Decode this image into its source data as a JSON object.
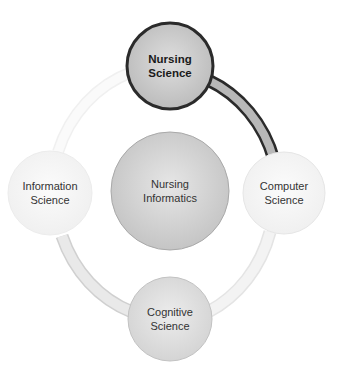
{
  "diagram": {
    "center": {
      "line1": "Nursing",
      "line2": "Informatics"
    },
    "nodes": [
      {
        "id": "nursing-science",
        "line1": "Nursing",
        "line2": "Science",
        "highlighted": true
      },
      {
        "id": "computer-science",
        "line1": "Computer",
        "line2": "Science",
        "highlighted": false
      },
      {
        "id": "cognitive-science",
        "line1": "Cognitive",
        "line2": "Science",
        "highlighted": false
      },
      {
        "id": "information-science",
        "line1": "Information",
        "line2": "Science",
        "highlighted": false
      }
    ],
    "colors": {
      "highlight_fill": "#c4c4c4",
      "highlight_stroke": "#2b2b2b",
      "center_fill": "#cfcfcf",
      "node_fill": "#f6f6f6",
      "ring_fill": "#ededed",
      "ring_stroke": "#d9d9d9"
    }
  }
}
